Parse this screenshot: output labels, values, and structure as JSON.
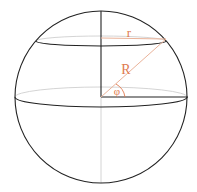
{
  "diagram": {
    "labels": {
      "small_radius": "r",
      "big_radius": "R",
      "angle": "φ"
    },
    "colors": {
      "outline": "#222222",
      "hidden_line": "#c8c8c8",
      "accent": "#e07a50",
      "background": "#ffffff"
    }
  }
}
